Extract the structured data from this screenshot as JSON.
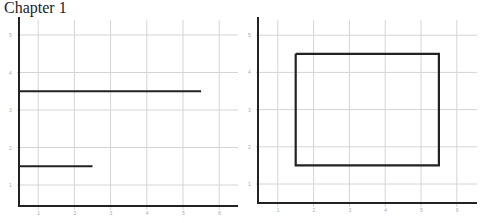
{
  "header": {
    "title": "Chapter 1"
  },
  "chart_data": [
    {
      "type": "line",
      "title": "",
      "xlabel": "",
      "ylabel": "",
      "xlim": [
        0.5,
        6.5
      ],
      "ylim": [
        0.45,
        5.5
      ],
      "x_ticks": [
        1,
        2,
        3,
        4,
        5,
        6
      ],
      "y_ticks": [
        1,
        2,
        3,
        4,
        5
      ],
      "grid": true,
      "series": [
        {
          "name": "segment-1",
          "x": [
            0.5,
            5.5
          ],
          "y": [
            3.5,
            3.5
          ]
        },
        {
          "name": "segment-2",
          "x": [
            0.5,
            2.5
          ],
          "y": [
            1.5,
            1.5
          ]
        }
      ]
    },
    {
      "type": "line",
      "title": "",
      "xlabel": "",
      "ylabel": "",
      "xlim": [
        0.45,
        6.6
      ],
      "ylim": [
        0.5,
        5.5
      ],
      "x_ticks": [
        1,
        2,
        3,
        4,
        5,
        6
      ],
      "y_ticks": [
        1,
        2,
        3,
        4,
        5
      ],
      "grid": true,
      "series": [
        {
          "name": "rectangle",
          "x": [
            1.5,
            5.5,
            5.5,
            1.5,
            1.5
          ],
          "y": [
            4.5,
            4.5,
            1.5,
            1.5,
            4.5
          ]
        }
      ]
    }
  ]
}
